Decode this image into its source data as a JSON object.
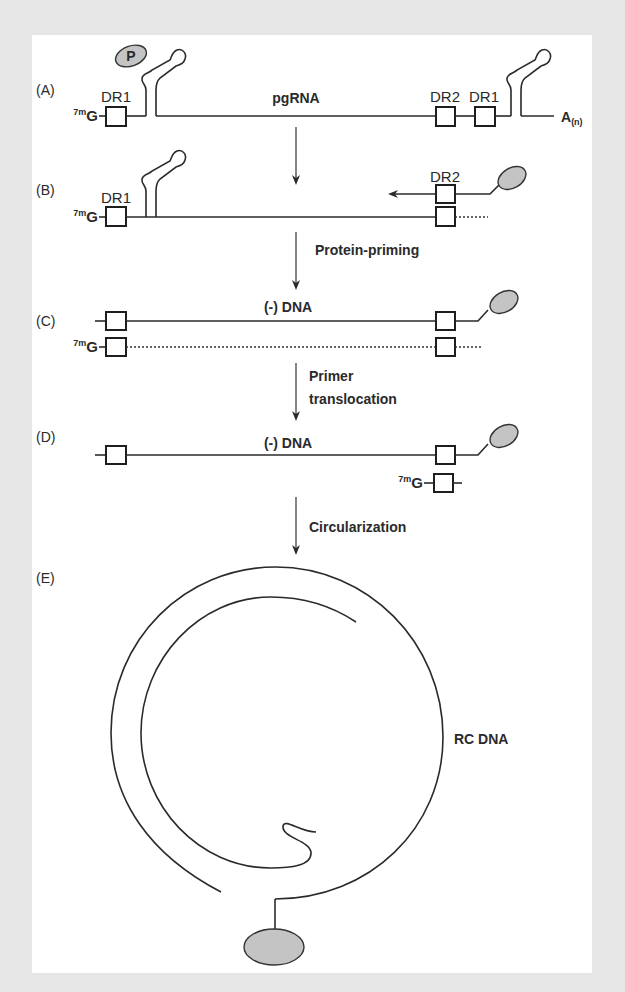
{
  "figure": {
    "panels": {
      "A": {
        "label": "(A)",
        "cap": "G",
        "cap_prefix": "7m",
        "dr_left": "DR1",
        "title": "pgRNA",
        "dr_right_1": "DR2",
        "dr_right_2": "DR1",
        "polyA": "A",
        "polyA_sub": "(n)",
        "protein_label": "P"
      },
      "B": {
        "label": "(B)",
        "cap": "G",
        "cap_prefix": "7m",
        "dr_left": "DR1",
        "dr_right": "DR2"
      },
      "C": {
        "label": "(C)",
        "title": "(-) DNA",
        "cap": "G",
        "cap_prefix": "7m"
      },
      "D": {
        "label": "(D)",
        "title": "(-) DNA",
        "cap": "G",
        "cap_prefix": "7m"
      },
      "E": {
        "label": "(E)",
        "title": "RC DNA"
      }
    },
    "steps": [
      {
        "from": "A",
        "to": "B",
        "label": ""
      },
      {
        "from": "B",
        "to": "C",
        "label": "Protein-priming"
      },
      {
        "from": "C",
        "to": "D",
        "label_line1": "Primer",
        "label_line2": "translocation"
      },
      {
        "from": "D",
        "to": "E",
        "label": "Circularization"
      }
    ],
    "colors": {
      "background": "#e6e6e6",
      "panel": "#ffffff",
      "line": "#2a2a2a",
      "protein_fill": "#c4c4c4"
    }
  }
}
